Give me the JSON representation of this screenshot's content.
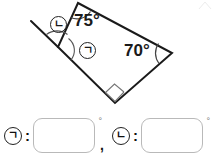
{
  "figure": {
    "name": "angle-diagram",
    "angles": {
      "top_vertex_label": "75°",
      "right_vertex_label": "70°",
      "bottom_vertex": "right-angle-marker"
    },
    "markers": {
      "nieun": "ㄴ",
      "giyeok": "ㄱ"
    },
    "shape_note": "quadrilateral-with-extended-ray"
  },
  "answers": {
    "items": [
      {
        "marker": "ㄱ",
        "colon": ":",
        "value": "",
        "placeholder": "",
        "degree": "°"
      },
      {
        "marker": "ㄴ",
        "colon": ":",
        "value": "",
        "placeholder": "",
        "degree": "°"
      }
    ],
    "separator": ","
  },
  "colors": {
    "stroke": "#1a1a1a",
    "box_border": "#b9b9b9",
    "background": "#ffffff"
  }
}
